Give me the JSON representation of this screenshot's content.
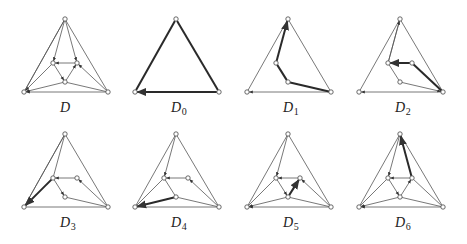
{
  "figure": {
    "layout": {
      "cols": 4,
      "rows": 2
    },
    "colors": {
      "edge": "#555555",
      "thick_edge": "#2a2a2a",
      "node_fill": "#ffffff"
    },
    "node_template": {
      "T": [
        65,
        19
      ],
      "BL": [
        24,
        92
      ],
      "BR": [
        108,
        92
      ],
      "IL": [
        53,
        63
      ],
      "IR": [
        77,
        63
      ],
      "IB": [
        65,
        82
      ]
    },
    "panels": [
      {
        "label": "D",
        "subscript": "",
        "offset": [
          0,
          0
        ],
        "nodes": [
          "T",
          "BL",
          "BR",
          "IL",
          "IR",
          "IB"
        ],
        "edges": [
          [
            "T",
            "BL",
            0,
            0
          ],
          [
            "T",
            "BR",
            0,
            0
          ],
          [
            "BR",
            "BL",
            0,
            1
          ],
          [
            "T",
            "IL",
            0,
            1
          ],
          [
            "T",
            "IR",
            0,
            1
          ],
          [
            "IR",
            "IL",
            0,
            1
          ],
          [
            "IL",
            "IB",
            0,
            1
          ],
          [
            "IB",
            "IR",
            0,
            1
          ],
          [
            "IB",
            "BL",
            0,
            1
          ],
          [
            "IL",
            "BL",
            0,
            1
          ],
          [
            "BR",
            "IB",
            0,
            0
          ],
          [
            "BR",
            "IR",
            0,
            1
          ],
          [
            "T",
            "BL",
            0,
            0
          ]
        ]
      },
      {
        "label": "D",
        "subscript": "0",
        "offset": [
          111,
          0
        ],
        "nodes": [
          "T",
          "BL",
          "BR"
        ],
        "edges": [
          [
            "T",
            "BL",
            1,
            0
          ],
          [
            "T",
            "BR",
            1,
            0
          ],
          [
            "BR",
            "BL",
            1,
            1
          ]
        ]
      },
      {
        "label": "D",
        "subscript": "1",
        "offset": [
          223,
          0
        ],
        "nodes": [
          "T",
          "BL",
          "BR",
          "IL",
          "IB"
        ],
        "edges": [
          [
            "T",
            "BL",
            0,
            0
          ],
          [
            "T",
            "BR",
            0,
            0
          ],
          [
            "BR",
            "BL",
            0,
            1
          ],
          [
            "BR",
            "IB",
            1,
            0
          ],
          [
            "IB",
            "IL",
            1,
            0
          ],
          [
            "IL",
            "T",
            1,
            1
          ]
        ]
      },
      {
        "label": "D",
        "subscript": "2",
        "offset": [
          335,
          0
        ],
        "nodes": [
          "T",
          "BL",
          "BR",
          "IL",
          "IR",
          "IB"
        ],
        "edges": [
          [
            "T",
            "BL",
            0,
            0
          ],
          [
            "T",
            "BR",
            0,
            0
          ],
          [
            "BR",
            "BL",
            0,
            1
          ],
          [
            "T",
            "IL",
            0,
            0
          ],
          [
            "IL",
            "IB",
            0,
            0
          ],
          [
            "IB",
            "BR",
            0,
            1
          ],
          [
            "BR",
            "IR",
            1,
            0
          ],
          [
            "IR",
            "IL",
            1,
            1
          ],
          [
            "IL",
            "T",
            0,
            1
          ]
        ]
      },
      {
        "label": "D",
        "subscript": "3",
        "offset": [
          0,
          115
        ],
        "nodes": [
          "T",
          "BL",
          "BR",
          "IL",
          "IR",
          "IB"
        ],
        "edges": [
          [
            "T",
            "BL",
            0,
            0
          ],
          [
            "T",
            "BR",
            0,
            0
          ],
          [
            "BR",
            "BL",
            0,
            0
          ],
          [
            "T",
            "IL",
            0,
            0
          ],
          [
            "IR",
            "IL",
            0,
            1
          ],
          [
            "IL",
            "IB",
            0,
            1
          ],
          [
            "BR",
            "IB",
            0,
            0
          ],
          [
            "BR",
            "IR",
            0,
            1
          ],
          [
            "T",
            "BL",
            0,
            0
          ],
          [
            "IL",
            "BL",
            1,
            1
          ]
        ]
      },
      {
        "label": "D",
        "subscript": "4",
        "offset": [
          111,
          115
        ],
        "nodes": [
          "T",
          "BL",
          "BR",
          "IL",
          "IR",
          "IB"
        ],
        "edges": [
          [
            "T",
            "BL",
            0,
            0
          ],
          [
            "T",
            "BR",
            0,
            0
          ],
          [
            "BR",
            "BL",
            0,
            0
          ],
          [
            "T",
            "IL",
            0,
            1
          ],
          [
            "IR",
            "IL",
            0,
            1
          ],
          [
            "IL",
            "IB",
            0,
            0
          ],
          [
            "IL",
            "BL",
            0,
            0
          ],
          [
            "BR",
            "IB",
            0,
            0
          ],
          [
            "BR",
            "IR",
            0,
            1
          ],
          [
            "IB",
            "BL",
            1,
            1
          ]
        ]
      },
      {
        "label": "D",
        "subscript": "5",
        "offset": [
          223,
          115
        ],
        "nodes": [
          "T",
          "BL",
          "BR",
          "IL",
          "IR",
          "IB"
        ],
        "edges": [
          [
            "T",
            "BL",
            0,
            0
          ],
          [
            "T",
            "BR",
            0,
            0
          ],
          [
            "BR",
            "BL",
            0,
            1
          ],
          [
            "T",
            "IL",
            0,
            1
          ],
          [
            "IR",
            "IL",
            0,
            1
          ],
          [
            "IL",
            "IB",
            0,
            1
          ],
          [
            "IB",
            "BL",
            0,
            1
          ],
          [
            "IL",
            "BL",
            0,
            0
          ],
          [
            "BR",
            "IB",
            0,
            0
          ],
          [
            "BR",
            "IR",
            0,
            1
          ],
          [
            "IB",
            "IR",
            1,
            1
          ]
        ]
      },
      {
        "label": "D",
        "subscript": "6",
        "offset": [
          335,
          115
        ],
        "nodes": [
          "T",
          "BL",
          "BR",
          "IL",
          "IR",
          "IB"
        ],
        "edges": [
          [
            "T",
            "BL",
            0,
            0
          ],
          [
            "T",
            "BR",
            0,
            0
          ],
          [
            "BR",
            "BL",
            0,
            1
          ],
          [
            "T",
            "IL",
            0,
            1
          ],
          [
            "IR",
            "IL",
            0,
            1
          ],
          [
            "IL",
            "IB",
            0,
            1
          ],
          [
            "IB",
            "IR",
            0,
            1
          ],
          [
            "IB",
            "BL",
            0,
            1
          ],
          [
            "IL",
            "BL",
            0,
            0
          ],
          [
            "BR",
            "IB",
            0,
            0
          ],
          [
            "BR",
            "IR",
            0,
            0
          ],
          [
            "IR",
            "T",
            1,
            1
          ]
        ]
      }
    ]
  }
}
